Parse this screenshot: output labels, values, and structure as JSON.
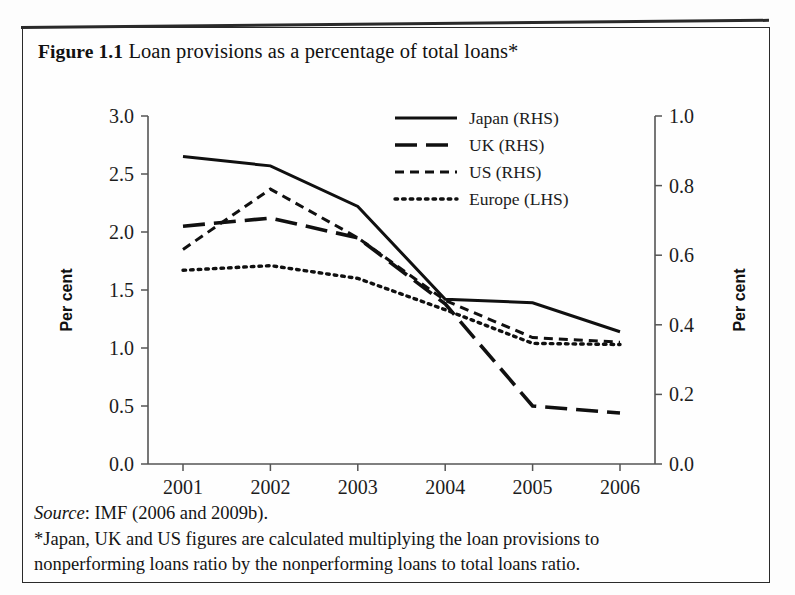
{
  "figure": {
    "label": "Figure 1.1",
    "title": "Loan provisions as a percentage of total loans*",
    "source": "Source",
    "source_rest": ": IMF (2006 and 2009b).",
    "note_line1": "*Japan, UK and US figures are calculated multiplying the loan provisions to",
    "note_line2": "nonperforming loans ratio by the nonperforming loans to total loans ratio."
  },
  "chart_data": {
    "type": "line",
    "title": "Loan provisions as a percentage of total loans*",
    "xlabel": "",
    "ylabel": "Per cent",
    "y2label": "Per cent",
    "categories": [
      "2001",
      "2002",
      "2003",
      "2004",
      "2005",
      "2006"
    ],
    "x": [
      2001,
      2002,
      2003,
      2004,
      2005,
      2006
    ],
    "ylim": [
      0.0,
      3.0
    ],
    "y2lim": [
      0.0,
      1.0
    ],
    "yticks": [
      "0.0",
      "0.5",
      "1.0",
      "1.5",
      "2.0",
      "2.5",
      "3.0"
    ],
    "ytick_values": [
      0.0,
      0.5,
      1.0,
      1.5,
      2.0,
      2.5,
      3.0
    ],
    "y2ticks": [
      "0.0",
      "0.2",
      "0.4",
      "0.6",
      "0.8",
      "1.0"
    ],
    "y2tick_values": [
      0.0,
      0.2,
      0.4,
      0.6,
      0.8,
      1.0
    ],
    "grid": false,
    "legend_position": "top-center",
    "series": [
      {
        "name": "Japan (RHS)",
        "axis": "right",
        "style": "solid",
        "color": "#101010",
        "values_left_scale": [
          2.65,
          2.57,
          2.22,
          1.42,
          1.39,
          1.14
        ],
        "values": [
          0.883,
          0.857,
          0.74,
          0.473,
          0.463,
          0.38
        ]
      },
      {
        "name": "UK (RHS)",
        "axis": "right",
        "style": "long-dash",
        "color": "#101010",
        "values_left_scale": [
          2.05,
          2.12,
          1.95,
          1.38,
          0.5,
          0.44
        ],
        "values": [
          0.683,
          0.707,
          0.65,
          0.46,
          0.167,
          0.147
        ]
      },
      {
        "name": "US (RHS)",
        "axis": "right",
        "style": "short-dash",
        "color": "#101010",
        "values_left_scale": [
          1.85,
          2.37,
          1.95,
          1.41,
          1.09,
          1.05
        ],
        "values": [
          0.617,
          0.79,
          0.65,
          0.47,
          0.363,
          0.35
        ]
      },
      {
        "name": "Europe (LHS)",
        "axis": "left",
        "style": "dotted",
        "color": "#101010",
        "values": [
          1.67,
          1.71,
          1.6,
          1.33,
          1.04,
          1.03
        ]
      }
    ]
  }
}
